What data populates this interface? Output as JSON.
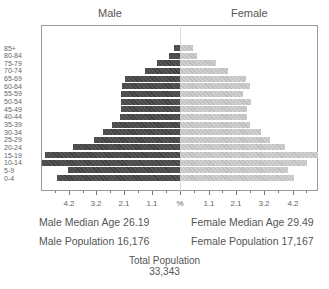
{
  "chart_data": {
    "type": "bar",
    "subtype": "population-pyramid",
    "title": "",
    "categories": [
      "85+",
      "80-84",
      "75-79",
      "70-74",
      "65-69",
      "60-64",
      "55-59",
      "50-54",
      "45-49",
      "40-44",
      "35-39",
      "30-34",
      "25-29",
      "20-24",
      "15-19",
      "10-14",
      "5-9",
      "0-4"
    ],
    "series": [
      {
        "name": "Male",
        "color": "#4a4a4a",
        "values": [
          0.23,
          0.42,
          0.88,
          1.34,
          2.1,
          2.21,
          2.25,
          2.25,
          2.25,
          2.29,
          2.6,
          2.94,
          3.28,
          4.09,
          5.15,
          5.27,
          4.27,
          4.69
        ]
      },
      {
        "name": "Female",
        "color": "#c6c6c6",
        "values": [
          0.5,
          0.65,
          1.37,
          1.83,
          2.52,
          2.67,
          2.4,
          2.71,
          2.56,
          2.56,
          2.67,
          3.09,
          3.44,
          4.01,
          5.3,
          4.85,
          4.12,
          4.35
        ]
      }
    ],
    "xlabel": "%",
    "ylabel": "",
    "x_ticks": [
      "4.2",
      "3.2",
      "2.1",
      "1.1",
      "%",
      "1.1",
      "2.1",
      "3.2",
      "4.2"
    ],
    "xlim": [
      -5.3,
      5.3
    ],
    "grid": false,
    "legend": {
      "left": "Male",
      "right": "Female",
      "position": "top"
    },
    "annotations": {
      "male_median_age": "Male Median Age 26.19",
      "female_median_age": "Female Median Age 29.49",
      "male_population": "Male Population 16,176",
      "female_population": "Female Population 17,167",
      "total_population_label": "Total Population",
      "total_population_value": "33,343"
    }
  },
  "header": {
    "male": "Male",
    "female": "Female"
  },
  "stats": {
    "male_median": "Male Median Age 26.19",
    "female_median": "Female Median Age 29.49",
    "male_pop": "Male Population 16,176",
    "female_pop": "Female Population 17,167",
    "total_label": "Total Population",
    "total_value": "33,343"
  }
}
